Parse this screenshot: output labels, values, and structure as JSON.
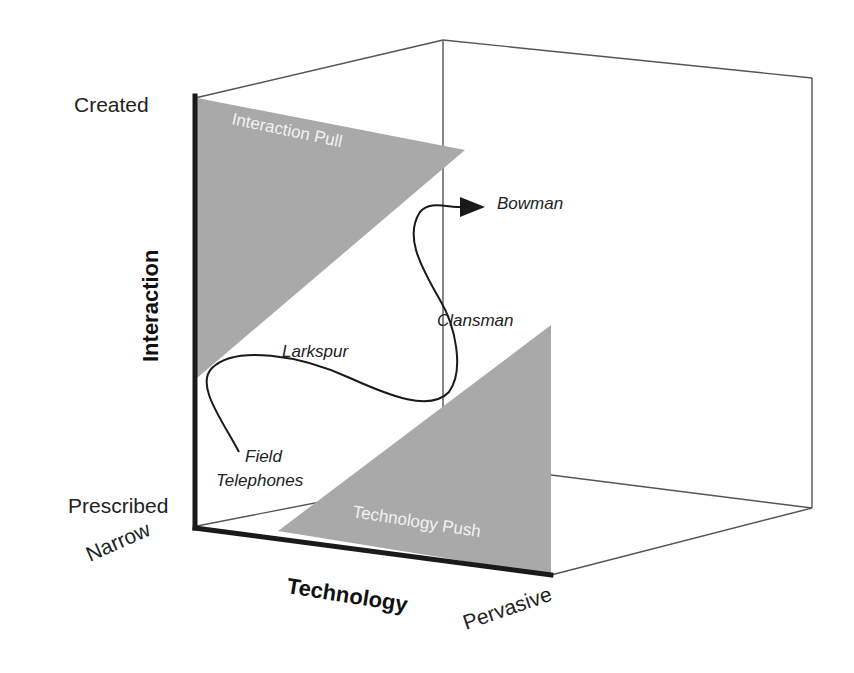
{
  "diagram": {
    "type": "3d-cube-framework",
    "colors": {
      "background": "#ffffff",
      "region_fill": "#a9a9a9",
      "axis_stroke": "#1a1a1a",
      "edge_stroke": "#555555",
      "region_text": "#f2f2f2",
      "label_text": "#222222"
    },
    "axes": {
      "vertical": {
        "title": "Interaction",
        "top_label": "Created",
        "bottom_label": "Prescribed"
      },
      "horizontal": {
        "title": "Technology",
        "start_label": "Narrow",
        "end_label": "Pervasive"
      }
    },
    "regions": [
      {
        "name": "interaction-pull",
        "label": "Interaction Pull"
      },
      {
        "name": "technology-push",
        "label": "Technology Push"
      }
    ],
    "trajectory": {
      "points": [
        {
          "label": "Field Telephones",
          "line1": "Field",
          "line2": "Telephones"
        },
        {
          "label": "Larkspur"
        },
        {
          "label": "Clansman"
        },
        {
          "label": "Bowman"
        }
      ],
      "arrow": "arrowhead-at-bowman"
    }
  }
}
